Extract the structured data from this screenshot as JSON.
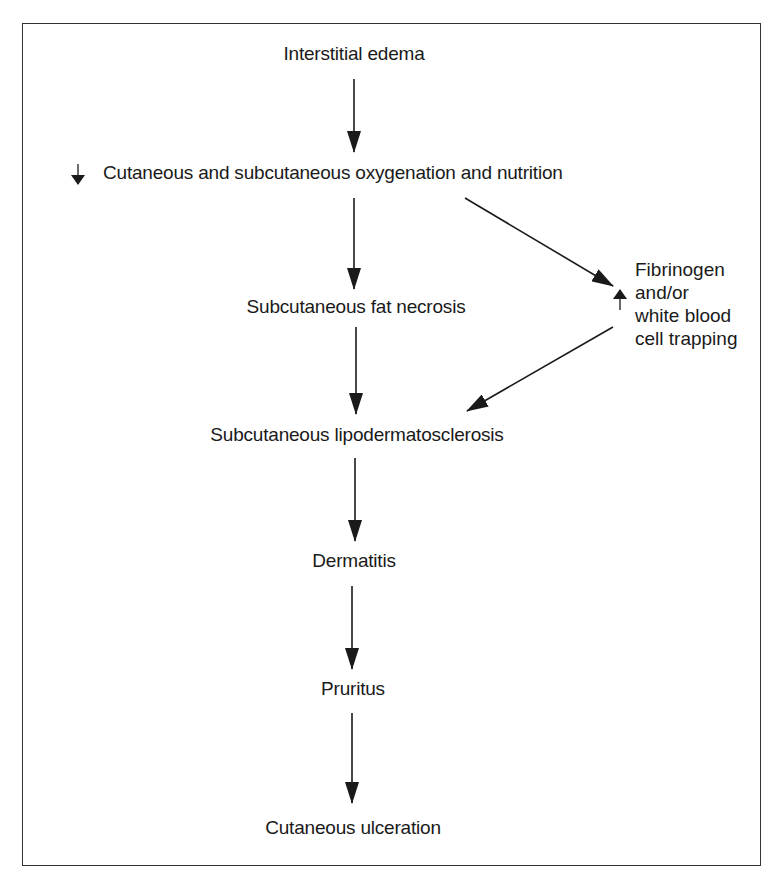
{
  "diagram": {
    "nodes": {
      "n1": "Interstitial edema",
      "n2": "Cutaneous and subcutaneous oxygenation and nutrition",
      "n2_modifier": "decreased",
      "n3": "Subcutaneous fat necrosis",
      "side": [
        "Fibrinogen",
        "and/or",
        "white blood",
        "cell trapping"
      ],
      "side_modifier": "increased",
      "n4": "Subcutaneous lipodermatosclerosis",
      "n5": "Dermatitis",
      "n6": "Pruritus",
      "n7": "Cutaneous ulceration"
    },
    "edges": [
      [
        "Interstitial edema",
        "Cutaneous and subcutaneous oxygenation and nutrition"
      ],
      [
        "Cutaneous and subcutaneous oxygenation and nutrition",
        "Subcutaneous fat necrosis"
      ],
      [
        "Cutaneous and subcutaneous oxygenation and nutrition",
        "Fibrinogen and/or white blood cell trapping"
      ],
      [
        "Fibrinogen and/or white blood cell trapping",
        "Subcutaneous lipodermatosclerosis"
      ],
      [
        "Subcutaneous fat necrosis",
        "Subcutaneous lipodermatosclerosis"
      ],
      [
        "Subcutaneous lipodermatosclerosis",
        "Dermatitis"
      ],
      [
        "Dermatitis",
        "Pruritus"
      ],
      [
        "Pruritus",
        "Cutaneous ulceration"
      ]
    ],
    "colors": {
      "line": "#1a1a1a",
      "border": "#333333",
      "background": "#ffffff"
    }
  }
}
